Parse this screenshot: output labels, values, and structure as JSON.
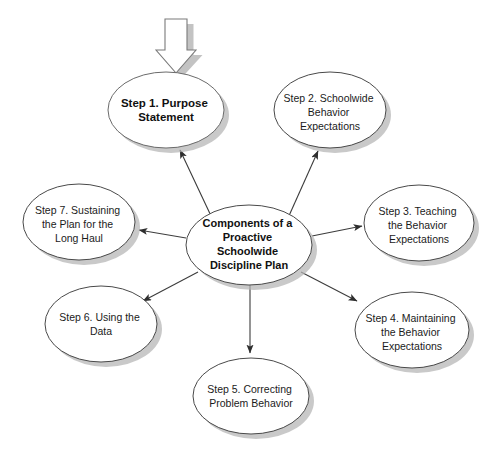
{
  "diagram": {
    "title": "Components of a Proactive Schoolwide Discipline Plan",
    "type": "hub-and-spoke radial diagram",
    "canvas": {
      "width": 499,
      "height": 459,
      "background": "#ffffff"
    },
    "colors": {
      "node_fill": "#ffffff",
      "node_stroke": "#4a4a4a",
      "highlight_fill_light": "#e2e2e2",
      "highlight_fill_dark": "#9a9a9a",
      "shadow": "#b4b4b4",
      "connector": "#3c3c3c",
      "text": "#1b1b1b"
    },
    "hub": {
      "id": "hub",
      "lines": [
        "Components of a",
        "Proactive",
        "Schoolwide",
        "Discipline Plan"
      ],
      "cx": 249,
      "cy": 245,
      "rx": 63,
      "ry": 40,
      "bold": true
    },
    "entry_arrow": {
      "name": "entry-block-arrow",
      "direction": "down",
      "points_to": "Step 1. Purpose Statement"
    },
    "nodes": [
      {
        "id": "step1",
        "lines": [
          "Step 1. Purpose",
          "Statement"
        ],
        "cx": 166,
        "cy": 110,
        "rx": 58,
        "ry": 38,
        "highlighted": true,
        "bold": true
      },
      {
        "id": "step2",
        "lines": [
          "Step 2. Schoolwide",
          "Behavior",
          "Expectations"
        ],
        "cx": 330,
        "cy": 110,
        "rx": 56,
        "ry": 38,
        "highlighted": false,
        "bold": false
      },
      {
        "id": "step3",
        "lines": [
          "Step 3. Teaching",
          "the Behavior",
          "Expectations"
        ],
        "cx": 419,
        "cy": 223,
        "rx": 55,
        "ry": 38,
        "highlighted": false,
        "bold": false
      },
      {
        "id": "step4",
        "lines": [
          "Step 4. Maintaining",
          "the Behavior",
          "Expectations"
        ],
        "cx": 412,
        "cy": 330,
        "rx": 57,
        "ry": 38,
        "highlighted": false,
        "bold": false
      },
      {
        "id": "step5",
        "lines": [
          "Step 5. Correcting",
          "Problem Behavior"
        ],
        "cx": 251,
        "cy": 396,
        "rx": 58,
        "ry": 38,
        "highlighted": false,
        "bold": false
      },
      {
        "id": "step6",
        "lines": [
          "Step 6. Using the",
          "Data"
        ],
        "cx": 101,
        "cy": 324,
        "rx": 56,
        "ry": 38,
        "highlighted": false,
        "bold": false
      },
      {
        "id": "step7",
        "lines": [
          "Step 7. Sustaining",
          "the Plan for the",
          "Long Haul"
        ],
        "cx": 79,
        "cy": 222,
        "rx": 56,
        "ry": 38,
        "highlighted": false,
        "bold": false
      }
    ],
    "connectors": [
      {
        "from": "hub",
        "to": "step1",
        "arrowhead": "at-target"
      },
      {
        "from": "hub",
        "to": "step2",
        "arrowhead": "at-target"
      },
      {
        "from": "hub",
        "to": "step3",
        "arrowhead": "at-target"
      },
      {
        "from": "hub",
        "to": "step4",
        "arrowhead": "at-target"
      },
      {
        "from": "hub",
        "to": "step5",
        "arrowhead": "at-target"
      },
      {
        "from": "hub",
        "to": "step6",
        "arrowhead": "at-target"
      },
      {
        "from": "hub",
        "to": "step7",
        "arrowhead": "at-target"
      }
    ]
  }
}
